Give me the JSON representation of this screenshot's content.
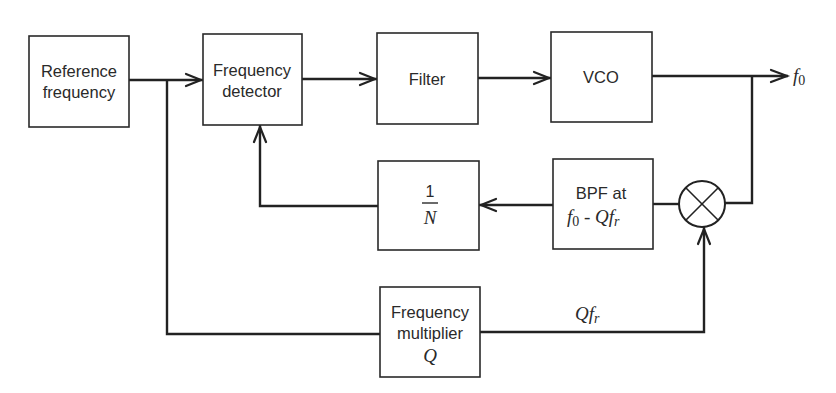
{
  "diagram": {
    "type": "block-diagram",
    "blocks": {
      "reference": {
        "line1": "Reference",
        "line2": "frequency"
      },
      "detector": {
        "line1": "Frequency",
        "line2": "detector"
      },
      "filter": {
        "label": "Filter"
      },
      "vco": {
        "label": "VCO"
      },
      "divider": {
        "numerator": "1",
        "denominator": "N"
      },
      "bpf": {
        "line1": "BPF at",
        "line2_f": "f",
        "line2_sub": "0",
        "line2_rest": " - Qf",
        "line2_rest_sub": "r"
      },
      "multiplier": {
        "line1": "Frequency",
        "line2": "multiplier",
        "line3": "Q"
      },
      "mixer": {
        "symbol": "mixer-circle-x"
      }
    },
    "signals": {
      "output": {
        "f": "f",
        "sub": "0"
      },
      "qfr": {
        "q": "Qf",
        "sub": "r"
      }
    },
    "connections": [
      {
        "from": "reference",
        "to": "detector"
      },
      {
        "from": "detector",
        "to": "filter"
      },
      {
        "from": "filter",
        "to": "vco"
      },
      {
        "from": "vco",
        "to": "output"
      },
      {
        "from": "vco",
        "to": "mixer"
      },
      {
        "from": "mixer",
        "to": "bpf"
      },
      {
        "from": "bpf",
        "to": "divider"
      },
      {
        "from": "divider",
        "to": "detector"
      },
      {
        "from": "reference",
        "to": "multiplier"
      },
      {
        "from": "multiplier",
        "to": "mixer"
      }
    ]
  }
}
